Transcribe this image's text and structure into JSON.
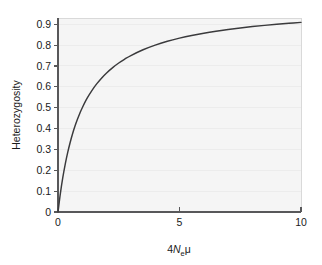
{
  "chart_data": {
    "type": "line",
    "title": "",
    "xlabel": "4Neμ",
    "xlabel_parts": {
      "prefix": "4",
      "variable": "N",
      "subscript": "e",
      "suffix": "μ"
    },
    "ylabel": "Heterozygosity",
    "xlim": [
      0,
      10
    ],
    "ylim": [
      0,
      0.93
    ],
    "xticks": [
      0,
      5,
      10
    ],
    "xtick_labels": [
      "0",
      "5",
      "10"
    ],
    "yticks": [
      0,
      0.1,
      0.2,
      0.3,
      0.4,
      0.5,
      0.6,
      0.7,
      0.8,
      0.9
    ],
    "ytick_labels": [
      "0",
      "0.1",
      "0.2",
      "0.3",
      "0.4",
      "0.5",
      "0.6",
      "0.7",
      "0.8",
      "0.9"
    ],
    "grid": "horizontal-faint",
    "legend": null,
    "series": [
      {
        "name": "Heterozygosity",
        "color": "#3a3a3c",
        "x": [
          0.0,
          0.1,
          0.2,
          0.3,
          0.4,
          0.5,
          0.6,
          0.7,
          0.8,
          0.9,
          1.0,
          1.2,
          1.4,
          1.6,
          1.8,
          2.0,
          2.25,
          2.5,
          2.75,
          3.0,
          3.5,
          4.0,
          4.5,
          5.0,
          5.5,
          6.0,
          6.5,
          7.0,
          7.5,
          8.0,
          8.5,
          9.0,
          9.5,
          10.0
        ],
        "values": [
          0.0,
          0.0909,
          0.1667,
          0.2308,
          0.2857,
          0.3333,
          0.375,
          0.4118,
          0.4444,
          0.4737,
          0.5,
          0.5455,
          0.5833,
          0.6154,
          0.6429,
          0.6667,
          0.6923,
          0.7143,
          0.7333,
          0.75,
          0.7778,
          0.8,
          0.8182,
          0.8333,
          0.8462,
          0.8571,
          0.8667,
          0.875,
          0.8824,
          0.8889,
          0.8947,
          0.9,
          0.9048,
          0.9091
        ]
      }
    ]
  },
  "colors": {
    "curve": "#3a3a3c",
    "axis": "#58585a",
    "plot_background": "#f5f5f5",
    "gridline": "#ececec",
    "figure_background": "#ffffff"
  }
}
